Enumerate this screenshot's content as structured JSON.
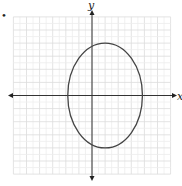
{
  "chart_data": {
    "type": "line",
    "title": "",
    "xlabel": "x",
    "ylabel": "y",
    "grid": true,
    "xlim": [
      -6,
      6
    ],
    "ylim": [
      -6,
      6
    ],
    "grid_step": 1,
    "curve": {
      "kind": "ellipse",
      "equation": "(x-1)^2/9 + y^2/16 = 1",
      "center": [
        1,
        0
      ],
      "semi_axis_x": 3,
      "semi_axis_y": 4,
      "vertices": [
        [
          1,
          4
        ],
        [
          1,
          -4
        ],
        [
          -2,
          0
        ],
        [
          4,
          0
        ]
      ]
    },
    "bullet_marker": "•"
  },
  "labels": {
    "x_axis": "x",
    "y_axis": "y",
    "bullet": "•"
  },
  "colors": {
    "grid": "#dcdcdc",
    "axis": "#333333",
    "curve": "#444444"
  }
}
